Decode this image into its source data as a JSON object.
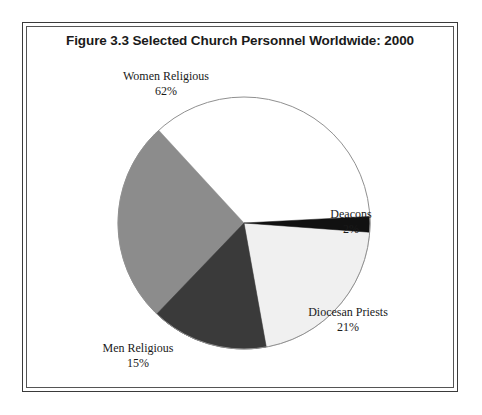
{
  "figure": {
    "title": "Figure 3.3 Selected Church Personnel Worldwide: 2000"
  },
  "chart_data": {
    "type": "pie",
    "title": "Figure 3.3 Selected Church Personnel Worldwide: 2000",
    "xlabel": "",
    "ylabel": "",
    "legend_position": "none",
    "grid": false,
    "unit": "percent",
    "categories": [
      "Women Religious",
      "Diocesan Priests",
      "Men Religious",
      "Deacons"
    ],
    "values": [
      62,
      21,
      15,
      2
    ],
    "slices": [
      {
        "name": "Women Religious",
        "label": "Women Religious",
        "value": 62,
        "value_label": "62%",
        "color": "#8c8c8c",
        "start_angle": 94.2,
        "sweep_angle": 223.2
      },
      {
        "name": "Diocesan Priests",
        "label": "Diocesan Priests",
        "value": 21,
        "value_label": "21%",
        "color": "#f0f0f0",
        "start_angle": 94.2,
        "sweep_angle": 75.6
      },
      {
        "name": "Men Religious",
        "label": "Men Religious",
        "value": 15,
        "value_label": "15%",
        "color": "#3a3a3a",
        "start_angle": 169.8,
        "sweep_angle": 54.0
      },
      {
        "name": "Deacons",
        "label": "Deacons",
        "value": 2,
        "value_label": "2%",
        "color": "#111111",
        "start_angle": 87.0,
        "sweep_angle": 7.2
      }
    ],
    "colors": {
      "women_religious": "#8c8c8c",
      "diocesan_priests": "#f0f0f0",
      "men_religious": "#3a3a3a",
      "deacons": "#111111",
      "outline": "#808080",
      "text": "#1a1a1a",
      "frame": "#3a3a3a"
    }
  }
}
